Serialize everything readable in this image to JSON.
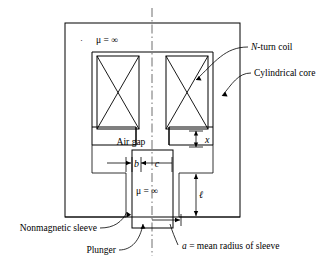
{
  "figure": {
    "type": "engineering-cross-section",
    "labels": {
      "n_turn_coil": "N-turn coil",
      "n_turn_coil_italic": "N",
      "n_turn_coil_rest": "-turn coil",
      "cylindrical_core": "Cylindrical core",
      "nonmagnetic_sleeve": "Nonmagnetic sleeve",
      "plunger": "Plunger",
      "air_gap": "Air gap",
      "mean_radius_italic": "a",
      "mean_radius_rest": " = mean radius of sleeve",
      "mean_radius_full": "a = mean radius of sleeve"
    },
    "permeability": {
      "core_mu": "μ = ∞",
      "plunger_mu": "μ = ∞",
      "mu_symbol": "μ",
      "equals_infinity": "= ∞",
      "dot_marker": "·"
    },
    "dimensions": {
      "air_gap_length": "x",
      "sleeve_thickness": "b",
      "plunger_half_width": "c",
      "core_leg_length": "ℓ",
      "mean_radius": "a"
    },
    "colors": {
      "line": "#000000",
      "centerline": "#4a4a4a",
      "background": "#ffffff"
    }
  }
}
